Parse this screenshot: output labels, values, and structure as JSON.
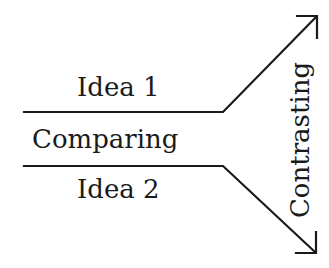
{
  "diagram": {
    "labels": {
      "idea1": "Idea 1",
      "comparing": "Comparing",
      "idea2": "Idea 2",
      "contrasting": "Contrasting"
    },
    "colors": {
      "stroke": "#1a1a1a",
      "background": "#ffffff"
    }
  }
}
